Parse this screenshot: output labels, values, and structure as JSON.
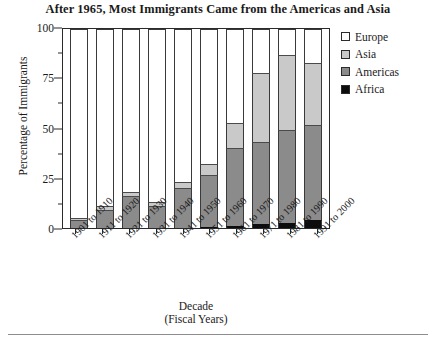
{
  "title": "After 1965, Most Immigrants Came from the Americas and Asia",
  "axes": {
    "ylabel": "Percentage of Immigrants",
    "xlabel_line1": "Decade",
    "xlabel_line2": "(Fiscal Years)",
    "yticks": [
      "0",
      "25",
      "50",
      "75",
      "100"
    ]
  },
  "legend": {
    "items": [
      {
        "label": "Europe",
        "color": "#ffffff"
      },
      {
        "label": "Asia",
        "color": "#c9c9c9"
      },
      {
        "label": "Americas",
        "color": "#8b8b8b"
      },
      {
        "label": "Africa",
        "color": "#0d0d0d"
      }
    ]
  },
  "chart_data": {
    "type": "bar",
    "subtype": "stacked-100",
    "title": "After 1965, Most Immigrants Came from the Americas and Asia",
    "xlabel": "Decade (Fiscal Years)",
    "ylabel": "Percentage of Immigrants",
    "ylim": [
      0,
      100
    ],
    "ytick_values": [
      0,
      25,
      50,
      75,
      100
    ],
    "grid": false,
    "legend_position": "right",
    "stack_order_bottom_to_top": [
      "Africa",
      "Americas",
      "Asia",
      "Europe"
    ],
    "categories": [
      "1901 to 1910",
      "1911 to 1920",
      "1921 to 1930",
      "1931 to 1940",
      "1941 to 1950",
      "1951 to 1960",
      "1961 to 1970",
      "1971 to 1980",
      "1981 to 1990",
      "1991 to 2000"
    ],
    "series": [
      {
        "name": "Africa",
        "color": "#0d0d0d",
        "values": [
          0,
          0,
          0,
          0,
          0,
          0.5,
          1,
          2,
          2.5,
          4
        ]
      },
      {
        "name": "Americas",
        "color": "#8b8b8b",
        "values": [
          4,
          9,
          16,
          11,
          20,
          26,
          39,
          41,
          47,
          48
        ]
      },
      {
        "name": "Asia",
        "color": "#c9c9c9",
        "values": [
          1,
          2,
          2,
          2,
          3,
          5.5,
          13,
          35,
          37.5,
          31
        ]
      },
      {
        "name": "Europe",
        "color": "#ffffff",
        "values": [
          95,
          89,
          82,
          87,
          77,
          68,
          47,
          22,
          13,
          17
        ]
      }
    ],
    "cumulative_tops": {
      "africa": [
        0,
        0,
        0,
        0,
        0,
        0.5,
        1,
        2,
        2.5,
        4
      ],
      "americas": [
        4,
        9,
        16,
        11,
        20,
        26.5,
        40,
        43,
        49.5,
        52
      ],
      "asia": [
        5,
        11,
        18,
        13,
        23,
        32,
        53,
        78,
        87,
        83
      ],
      "europe": [
        100,
        100,
        100,
        100,
        100,
        100,
        100,
        100,
        100,
        100
      ]
    }
  }
}
